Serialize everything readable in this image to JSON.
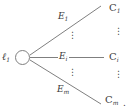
{
  "diagram": {
    "type": "tree-graph",
    "title": "",
    "colors": {
      "stroke": "#7a7a7a",
      "text": "#3a3a3a",
      "background": "#ffffff"
    },
    "root": {
      "name": "root-node",
      "label_base": "ℓ",
      "label_sub": "1",
      "shape": "circle"
    },
    "edges": [
      {
        "id": "e1",
        "label_base": "E",
        "label_sub": "1"
      },
      {
        "id": "ei",
        "label_base": "E",
        "label_sub": "i"
      },
      {
        "id": "em",
        "label_base": "E",
        "label_sub": "m"
      }
    ],
    "leaves": [
      {
        "id": "c1",
        "label_base": "C",
        "label_sub": "1"
      },
      {
        "id": "ci",
        "label_base": "C",
        "label_sub": "i"
      },
      {
        "id": "cm",
        "label_base": "C",
        "label_sub": "m"
      }
    ],
    "ellipses": {
      "glyph": "⋮",
      "positions": [
        "edges-upper",
        "edges-lower",
        "leaves-upper",
        "leaves-lower"
      ]
    },
    "trailing_punctuation": "."
  }
}
